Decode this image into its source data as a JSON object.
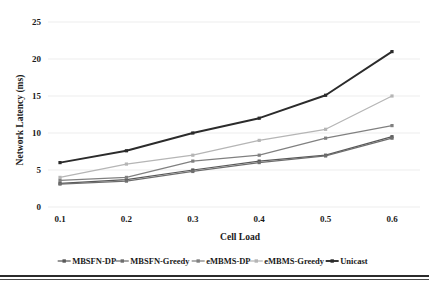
{
  "chart_data": {
    "type": "line",
    "title": "",
    "xlabel": "Cell Load",
    "ylabel": "Network Latency (ms)",
    "x": [
      0.1,
      0.2,
      0.3,
      0.4,
      0.5,
      0.6
    ],
    "categories": [
      "0.1",
      "0.2",
      "0.3",
      "0.4",
      "0.5",
      "0.6"
    ],
    "xticklabels": [
      "0.1",
      "0.2",
      "0.3",
      "0.4",
      "0.5",
      "0.6"
    ],
    "yticklabels": [
      "0",
      "5",
      "10",
      "15",
      "20",
      "25"
    ],
    "yticks": [
      0,
      5,
      10,
      15,
      20,
      25
    ],
    "ylim": [
      0,
      25
    ],
    "grid": "horizontal",
    "legend_position": "bottom",
    "series": [
      {
        "name": "MBSFN-DP",
        "color": "#595959",
        "values": [
          3.2,
          3.7,
          5.0,
          6.2,
          7.0,
          9.5
        ]
      },
      {
        "name": "MBSFN-Greedy",
        "color": "#6e6e6e",
        "values": [
          3.1,
          3.5,
          4.8,
          6.0,
          6.9,
          9.3
        ]
      },
      {
        "name": "eMBMS-DP",
        "color": "#808080",
        "values": [
          3.6,
          4.0,
          6.2,
          7.0,
          9.3,
          11.0
        ]
      },
      {
        "name": "eMBMS-Greedy",
        "color": "#b5b5b5",
        "values": [
          4.0,
          5.8,
          7.0,
          9.0,
          10.5,
          15.0
        ]
      },
      {
        "name": "Unicast",
        "color": "#2b2b2b",
        "values": [
          6.0,
          7.6,
          10.0,
          12.0,
          15.1,
          21.0
        ]
      }
    ]
  },
  "legend": {
    "items": [
      {
        "label": "MBSFN-DP",
        "color": "#595959"
      },
      {
        "label": "MBSFN-Greedy",
        "color": "#6e6e6e"
      },
      {
        "label": "eMBMS-DP",
        "color": "#808080"
      },
      {
        "label": "eMBMS-Greedy",
        "color": "#b5b5b5"
      },
      {
        "label": "Unicast",
        "color": "#2b2b2b"
      }
    ]
  }
}
